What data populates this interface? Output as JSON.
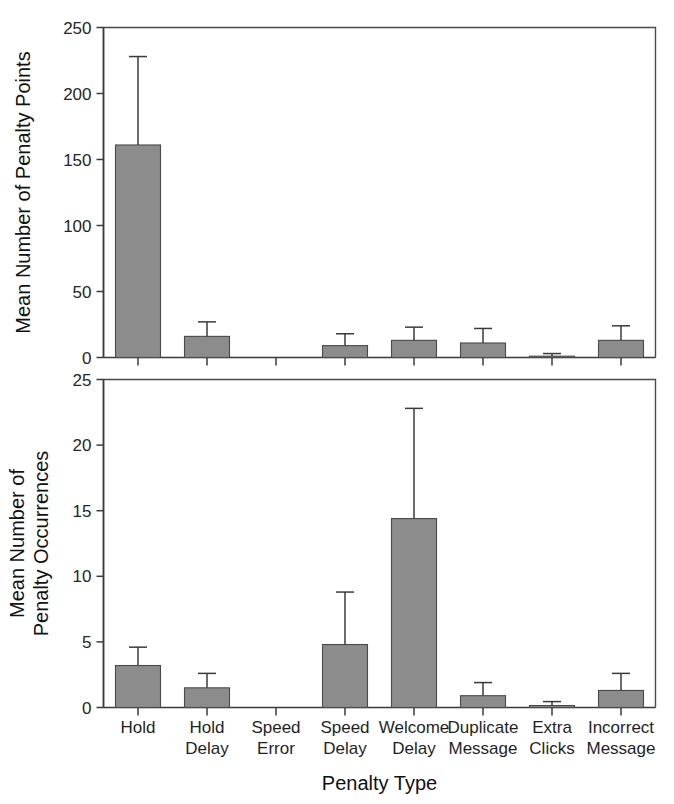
{
  "figure": {
    "xlabel": "Penalty Type",
    "categories": [
      "Hold",
      "Hold Delay",
      "Speed Error",
      "Speed Delay",
      "Welcome Delay",
      "Duplicate Message",
      "Extra Clicks",
      "Incorrect Message"
    ],
    "bar_color": "#8c8c8c",
    "bar_edge_color": "#4a4a4a",
    "axis_color": "#3a3a3a"
  },
  "chart_data": [
    {
      "type": "bar",
      "title": "",
      "panel": "top",
      "xlabel": "",
      "ylabel": "Mean Number of Penalty Points",
      "categories": [
        "Hold",
        "Hold Delay",
        "Speed Error",
        "Speed Delay",
        "Welcome Delay",
        "Duplicate Message",
        "Extra Clicks",
        "Incorrect Message"
      ],
      "category_lines": [
        [
          "Hold"
        ],
        [
          "Hold",
          "Delay"
        ],
        [
          "Speed",
          "Error"
        ],
        [
          "Speed",
          "Delay"
        ],
        [
          "Welcome",
          "Delay"
        ],
        [
          "Duplicate",
          "Message"
        ],
        [
          "Extra",
          "Clicks"
        ],
        [
          "Incorrect",
          "Message"
        ]
      ],
      "values": [
        161,
        16,
        0,
        9,
        13,
        11,
        1,
        13
      ],
      "error_upper": [
        228,
        27,
        0,
        18,
        23,
        22,
        3,
        24
      ],
      "errors": [
        67,
        11,
        0,
        9,
        10,
        11,
        2,
        11
      ],
      "ylim": [
        0,
        250
      ],
      "yticks": [
        0,
        50,
        100,
        150,
        200,
        250
      ],
      "ytick_labels": [
        "0",
        "50",
        "100",
        "150",
        "200",
        "250"
      ],
      "grid": false,
      "legend": "none"
    },
    {
      "type": "bar",
      "title": "",
      "panel": "bottom",
      "xlabel": "Penalty Type",
      "ylabel": "Mean Number of Penalty Occurrences",
      "ylabel_lines": [
        "Mean Number of",
        "Penalty Occurrences"
      ],
      "categories": [
        "Hold",
        "Hold Delay",
        "Speed Error",
        "Speed Delay",
        "Welcome Delay",
        "Duplicate Message",
        "Extra Clicks",
        "Incorrect Message"
      ],
      "category_lines": [
        [
          "Hold"
        ],
        [
          "Hold",
          "Delay"
        ],
        [
          "Speed",
          "Error"
        ],
        [
          "Speed",
          "Delay"
        ],
        [
          "Welcome",
          "Delay"
        ],
        [
          "Duplicate",
          "Message"
        ],
        [
          "Extra",
          "Clicks"
        ],
        [
          "Incorrect",
          "Message"
        ]
      ],
      "values": [
        3.2,
        1.5,
        0,
        4.8,
        14.4,
        0.9,
        0.15,
        1.3
      ],
      "error_upper": [
        4.6,
        2.6,
        0,
        8.8,
        22.8,
        1.9,
        0.45,
        2.6
      ],
      "errors": [
        1.4,
        1.1,
        0,
        4.0,
        8.4,
        1.0,
        0.3,
        1.3
      ],
      "ylim": [
        0,
        25
      ],
      "yticks": [
        0,
        5,
        10,
        15,
        20,
        25
      ],
      "ytick_labels": [
        "0",
        "5",
        "10",
        "15",
        "20",
        "25"
      ],
      "grid": false,
      "legend": "none"
    }
  ]
}
